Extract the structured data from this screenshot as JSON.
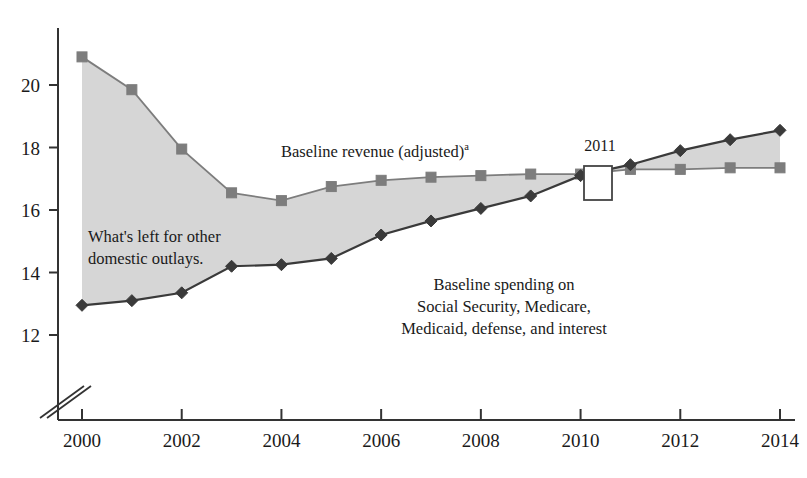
{
  "chart_data": {
    "type": "line",
    "title": "",
    "xlabel": "",
    "ylabel": "",
    "x": [
      2000,
      2001,
      2002,
      2003,
      2004,
      2005,
      2006,
      2007,
      2008,
      2009,
      2010,
      2011,
      2012,
      2013,
      2014
    ],
    "xlim": [
      1999.4,
      2014.35
    ],
    "ylim": [
      11.45,
      21.4
    ],
    "yticks": [
      12,
      14,
      16,
      18,
      20
    ],
    "ytick_labels": [
      "12",
      "14",
      "16",
      "18",
      "20"
    ],
    "xticks": [
      2000,
      2002,
      2004,
      2006,
      2008,
      2010,
      2012,
      2014
    ],
    "xtick_labels": [
      "2000",
      "2002",
      "2004",
      "2006",
      "2008",
      "2010",
      "2012",
      "2014"
    ],
    "grid": false,
    "legend": "none",
    "axis_break": true,
    "series": [
      {
        "name": "Baseline revenue (adjusted)",
        "marker": "square",
        "color": "#7d7d7d",
        "values": [
          20.9,
          19.85,
          17.95,
          16.55,
          16.3,
          16.75,
          16.95,
          17.05,
          17.1,
          17.15,
          17.15,
          17.3,
          17.3,
          17.35,
          17.35
        ]
      },
      {
        "name": "Baseline spending on Social Security, Medicare, Medicaid, defense, and interest",
        "marker": "diamond",
        "color": "#3a3a3a",
        "values": [
          12.95,
          13.1,
          13.35,
          14.2,
          14.25,
          14.45,
          15.2,
          15.65,
          16.05,
          16.45,
          17.1,
          17.45,
          17.9,
          18.25,
          18.55
        ]
      }
    ],
    "fill": {
      "between": [
        "Baseline revenue (adjusted)",
        "Baseline spending on Social Security, Medicare, Medicaid, defense, and interest"
      ],
      "color": "#d6d6d6",
      "label": "What's left for other domestic outlays."
    },
    "annotations": [
      {
        "name": "revenue-label",
        "lines": [
          "Baseline revenue (adjusted)"
        ],
        "superscript": "a",
        "x": 281,
        "y": 157
      },
      {
        "name": "shaded-area-label",
        "lines": [
          "What's left for other",
          "domestic outlays."
        ],
        "x": 88,
        "y": 242
      },
      {
        "name": "spending-label",
        "lines": [
          "Baseline spending on",
          "Social Security, Medicare,",
          "Medicaid, defense, and interest"
        ],
        "x": 504,
        "y": 290
      },
      {
        "name": "year-highlight-box",
        "label": "2011",
        "box_x": 584,
        "box_y": 166,
        "box_w": 28,
        "box_h": 34,
        "label_x": 600,
        "label_y": 151
      }
    ]
  },
  "axes": {
    "y_axis_name": "value-axis",
    "x_axis_name": "year-axis",
    "break_name": "axis-break-marker"
  }
}
